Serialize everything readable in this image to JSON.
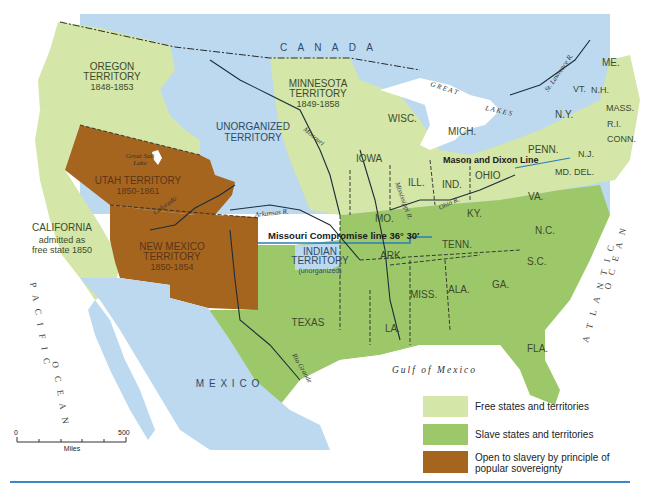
{
  "colors": {
    "free": "#d4e6a8",
    "slave": "#9cc86a",
    "popular_sovereignty": "#a6651f",
    "unorganized": "#bcd9ef",
    "water": "#a9cfe9",
    "compromise_line": "#2a7fb8",
    "rule": "#3a86c8"
  },
  "labels": {
    "canada": "C A N A D A",
    "oregon": {
      "name": "OREGON",
      "type": "TERRITORY",
      "years": "1848-1853"
    },
    "minnesota": {
      "name": "MINNESOTA",
      "type": "TERRITORY",
      "years": "1849-1858"
    },
    "unorganized": {
      "line1": "UNORGANIZED",
      "line2": "TERRITORY"
    },
    "utah": {
      "name": "UTAH TERRITORY",
      "years": "1850-1861"
    },
    "new_mexico": {
      "name": "NEW MEXICO",
      "type": "TERRITORY",
      "years": "1850-1854"
    },
    "california": {
      "name": "CALIFORNIA",
      "line2": "admitted as",
      "line3": "free state 1850"
    },
    "indian": {
      "name": "INDIAN",
      "type": "TERRITORY",
      "note": "(unorganized)"
    },
    "texas": "TEXAS",
    "mexico": "M E X I C O",
    "great_salt_lake": {
      "line1": "Great Salt",
      "line2": "Lake"
    },
    "missouri_r": "Missouri",
    "missouri_r_suffix": "R.",
    "arkansas_r": "Arkansas R.",
    "colorado_r": "Colorado",
    "colorado_r_suffix": "R.",
    "rio_grande": "Rio Grande",
    "mississippi_r": "Mississippi R.",
    "ohio_r": "Ohio R.",
    "st_lawrence_r": "St. Lawrence R.",
    "great_lakes_1": "G R E A T",
    "great_lakes_2": "L A K E S",
    "compromise": "Missouri Compromise line 36° 30′",
    "mason_dixon": "Mason and Dixon Line",
    "gulf": "Gulf  of  Mexico",
    "pacific": "P A C I F I C",
    "pacific_ocean": "O C E A N",
    "atlantic": "A T L A N T I C",
    "atlantic_ocean": "O C E A N",
    "states": {
      "me": "ME.",
      "vt": "VT.",
      "nh": "N.H.",
      "mass": "MASS.",
      "ri": "R.I.",
      "conn": "CONN.",
      "ny": "N.Y.",
      "nj": "N.J.",
      "penn": "PENN.",
      "md": "MD.",
      "del": "DEL.",
      "ohio": "OHIO",
      "mich": "MICH.",
      "ind": "IND.",
      "ill": "ILL.",
      "wisc": "WISC.",
      "iowa": "IOWA",
      "va": "VA.",
      "ky": "KY.",
      "mo": "MO.",
      "tenn": "TENN.",
      "nc": "N.C.",
      "sc": "S.C.",
      "ga": "GA.",
      "ala": "ALA.",
      "miss": "MISS.",
      "ark": "ARK.",
      "la": "LA.",
      "fla": "FLA."
    }
  },
  "scale": {
    "min": "0",
    "max": "500",
    "unit": "Miles"
  },
  "legend": [
    {
      "key": "free",
      "label": "Free states and territories"
    },
    {
      "key": "slave",
      "label": "Slave states and territories"
    },
    {
      "key": "popular_sovereignty",
      "label_line1": "Open to slavery by principle of",
      "label_line2": "popular sovereignty"
    }
  ]
}
